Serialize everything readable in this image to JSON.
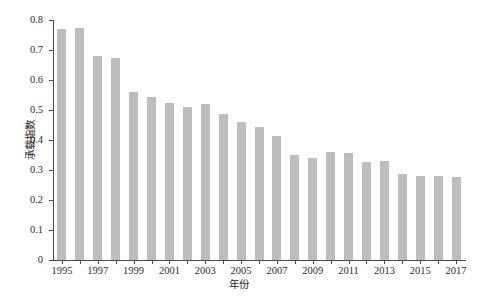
{
  "chart_data": {
    "type": "bar",
    "title": "",
    "xlabel": "年份",
    "ylabel": "承载指数",
    "grid": false,
    "legend": null,
    "bar_color": "#bdbdbd",
    "axis_color": "#4a4a4a",
    "ylim": [
      0,
      0.8
    ],
    "ytick_labels": [
      "0",
      "0.1",
      "0.2",
      "0.3",
      "0.4",
      "0.5",
      "0.6",
      "0.7",
      "0.8"
    ],
    "ytick_values": [
      0,
      0.1,
      0.2,
      0.3,
      0.4,
      0.5,
      0.6,
      0.7,
      0.8
    ],
    "xtick_labels": [
      "1995",
      "1997",
      "1999",
      "2001",
      "2003",
      "2005",
      "2007",
      "2009",
      "2011",
      "2013",
      "2015",
      "2017"
    ],
    "categories": [
      "1995",
      "1996",
      "1997",
      "1998",
      "1999",
      "2000",
      "2001",
      "2002",
      "2003",
      "2004",
      "2005",
      "2006",
      "2007",
      "2008",
      "2009",
      "2010",
      "2011",
      "2012",
      "2013",
      "2014",
      "2015",
      "2016",
      "2017"
    ],
    "values": [
      0.77,
      0.775,
      0.68,
      0.675,
      0.56,
      0.543,
      0.522,
      0.51,
      0.519,
      0.488,
      0.46,
      0.442,
      0.412,
      0.35,
      0.339,
      0.359,
      0.357,
      0.327,
      0.329,
      0.286,
      0.28,
      0.279,
      0.278
    ]
  },
  "caption": ""
}
